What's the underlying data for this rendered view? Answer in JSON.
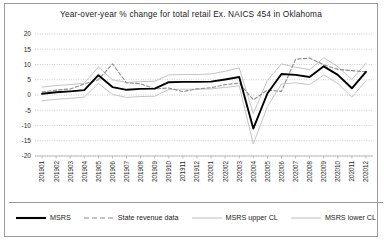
{
  "chart_data": {
    "type": "line",
    "title": "Year-over-year % change for total retail Ex. NAICS 454 in Oklahoma",
    "xlabel": "",
    "ylabel": "",
    "ylim": [
      -20,
      20
    ],
    "ytick_step": 5,
    "yticks": [
      "20",
      "15",
      "10",
      "5",
      "0",
      "-5",
      "-10",
      "-15",
      "-20"
    ],
    "grid": true,
    "legend_position": "bottom",
    "categories": [
      "201901",
      "201902",
      "201903",
      "201904",
      "201905",
      "201906",
      "201907",
      "201908",
      "201909",
      "201910",
      "201911",
      "201912",
      "202001",
      "202002",
      "202003",
      "202004",
      "202005",
      "202006",
      "202007",
      "202008",
      "202009",
      "202010",
      "202011",
      "202012"
    ],
    "series": [
      {
        "name": "MSRS",
        "style": "solid",
        "color": "#000000",
        "width": 1.9,
        "values": [
          0.4,
          0.9,
          1.2,
          1.6,
          6.5,
          2.6,
          1.7,
          2.0,
          2.1,
          4.2,
          4.3,
          4.3,
          4.4,
          5.1,
          5.9,
          -11.0,
          0.5,
          6.9,
          6.6,
          5.9,
          9.4,
          6.6,
          2.2,
          7.6
        ]
      },
      {
        "name": "State revenue data",
        "style": "dashed",
        "color": "#8c8c8c",
        "width": 1.1,
        "values": [
          1.0,
          1.6,
          2.0,
          3.6,
          5.0,
          10.2,
          4.0,
          3.7,
          2.0,
          2.3,
          1.1,
          2.0,
          2.4,
          3.4,
          3.9,
          -1.6,
          1.6,
          1.2,
          11.7,
          12.1,
          9.9,
          8.4,
          8.0,
          7.6
        ]
      },
      {
        "name": "MSRS upper CL",
        "style": "solid",
        "color": "#bdbdbd",
        "width": 0.9,
        "values": [
          2.6,
          3.1,
          3.4,
          3.9,
          9.2,
          5.0,
          4.1,
          4.4,
          4.5,
          6.6,
          6.7,
          6.7,
          6.9,
          7.8,
          8.9,
          -6.1,
          4.8,
          10.2,
          9.1,
          8.3,
          12.2,
          9.3,
          5.1,
          10.4
        ]
      },
      {
        "name": "MSRS lower CL",
        "style": "solid",
        "color": "#bdbdbd",
        "width": 0.9,
        "values": [
          -1.9,
          -1.4,
          -1.1,
          -0.7,
          3.8,
          0.2,
          -0.8,
          -0.5,
          -0.4,
          1.8,
          1.9,
          1.9,
          2.0,
          2.5,
          3.0,
          -16.0,
          -3.8,
          3.6,
          4.0,
          3.4,
          6.6,
          3.8,
          -0.7,
          4.7
        ]
      }
    ]
  },
  "legend": {
    "items": [
      {
        "label": "MSRS",
        "swatch": "solid-thick-black"
      },
      {
        "label": "State revenue data",
        "swatch": "dashed-gray"
      },
      {
        "label": "MSRS upper CL",
        "swatch": "solid-light-gray"
      },
      {
        "label": "MSRS lower CL",
        "swatch": "solid-light-gray"
      }
    ]
  }
}
